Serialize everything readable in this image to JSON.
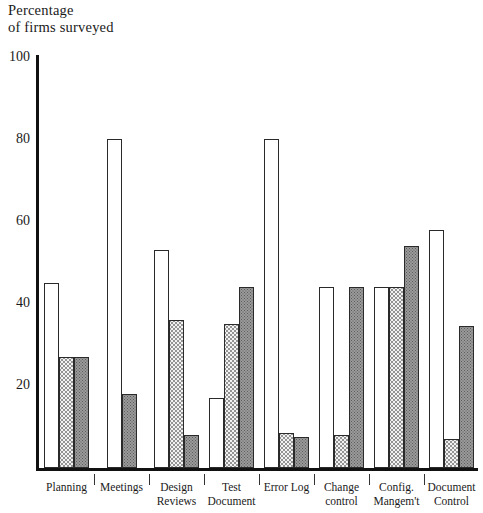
{
  "chart_data": {
    "type": "bar",
    "title": "",
    "ylabel": "Percentage\nof firms surveyed",
    "xlabel": "",
    "ylim": [
      0,
      100
    ],
    "yticks": [
      20,
      40,
      60,
      80,
      100
    ],
    "grid": false,
    "legend_position": "none",
    "categories": [
      "Planning",
      "Meetings",
      "Design\nReviews",
      "Test\nDocument",
      "Error Log",
      "Change\ncontrol",
      "Config.\nMangem't",
      "Document\nControl"
    ],
    "series": [
      {
        "name": "open",
        "pattern": "white",
        "values": [
          45,
          80,
          53,
          17,
          80,
          44,
          44,
          58
        ]
      },
      {
        "name": "dotted",
        "pattern": "light-stipple",
        "values": [
          27,
          0,
          36,
          35,
          8.5,
          8,
          44,
          7
        ]
      },
      {
        "name": "solid",
        "pattern": "dark-stipple",
        "values": [
          27,
          18,
          8,
          44,
          7.5,
          44,
          54,
          34.5
        ]
      }
    ]
  },
  "axis": {
    "title_text": "Percentage\nof firms surveyed",
    "tick_100": "100",
    "tick_80": "80",
    "tick_60": "60",
    "tick_40": "40",
    "tick_20": "20"
  },
  "labels": {
    "cat0": "Planning",
    "cat1": "Meetings",
    "cat2": "Design\nReviews",
    "cat3": "Test\nDocument",
    "cat4": "Error Log",
    "cat5": "Change\ncontrol",
    "cat6": "Config.\nMangem't",
    "cat7": "Document\nControl"
  },
  "colors": {
    "axis": "#111111",
    "bar_outline": "#2a2a2a",
    "dotted_fill": "#f2f2f2",
    "solid_fill": "#9a9a9a",
    "background": "#ffffff"
  }
}
